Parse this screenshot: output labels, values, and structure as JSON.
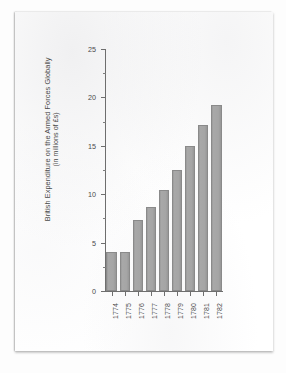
{
  "document": {
    "kind": "scanned-page"
  },
  "chart_data": {
    "type": "bar",
    "title": "",
    "xlabel": "",
    "ylabel": "British Expenditure on the Armed Forces Globally",
    "ylabel_line2": "(in millions of £s)",
    "categories": [
      "1774",
      "1775",
      "1776",
      "1777",
      "1778",
      "1779",
      "1780",
      "1781",
      "1782"
    ],
    "values": [
      4.0,
      4.0,
      7.3,
      8.7,
      10.4,
      12.5,
      15.0,
      17.1,
      19.2
    ],
    "ylim": [
      0,
      25
    ],
    "ytick_values": [
      0,
      5,
      10,
      15,
      20,
      25
    ],
    "ytick_labels": [
      "0",
      "5",
      "10",
      "15",
      "20",
      "25"
    ],
    "yminor_tick_values": [
      2.5,
      7.5,
      12.5,
      17.5,
      22.5
    ],
    "grid": false,
    "legend": false,
    "bar_color": "#a5a5a5",
    "axis_color": "#6e6e6e",
    "text_color": "#4a4a4a"
  }
}
